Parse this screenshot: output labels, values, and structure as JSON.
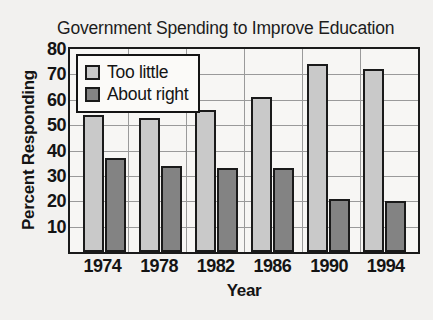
{
  "chart_data": {
    "type": "bar",
    "title": "Government Spending to Improve Education",
    "xlabel": "Year",
    "ylabel": "Percent Responding",
    "categories": [
      "1974",
      "1978",
      "1982",
      "1986",
      "1990",
      "1994"
    ],
    "series": [
      {
        "name": "Too little",
        "color": "#c9c9c9",
        "values": [
          54,
          53,
          56,
          61,
          74,
          72
        ]
      },
      {
        "name": "About right",
        "color": "#838383",
        "values": [
          37,
          34,
          33,
          33,
          21,
          20
        ]
      }
    ],
    "ylim": [
      0,
      80
    ],
    "yticks": [
      80,
      70,
      60,
      50,
      40,
      30,
      20,
      10
    ],
    "grid": true,
    "legend_position": "top-left"
  }
}
